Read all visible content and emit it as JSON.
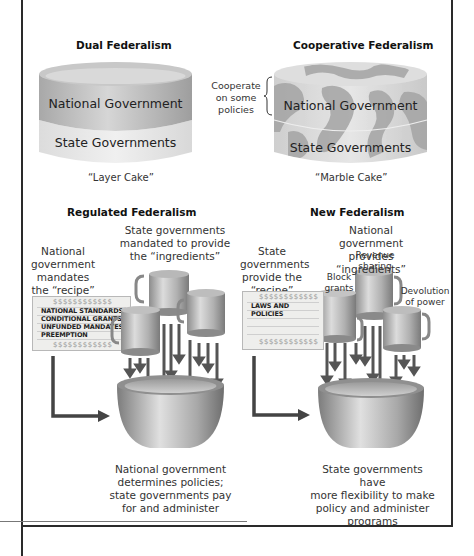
{
  "dual": {
    "title": "Dual Federalism",
    "top_layer": "National Government",
    "bottom_layer": "State Governments",
    "caption": "“Layer Cake”"
  },
  "cooperative": {
    "title": "Cooperative Federalism",
    "side_note_lines": [
      "Cooperate",
      "on some",
      "policies"
    ],
    "top_layer": "National Government",
    "bottom_layer": "State Governments",
    "caption": "“Marble Cake”"
  },
  "regulated": {
    "title": "Regulated Federalism",
    "ingredients_label_lines": [
      "State governments",
      "mandated to provide",
      "the “ingredients”"
    ],
    "recipe_label_lines": [
      "National",
      "government",
      "mandates",
      "the “recipe”"
    ],
    "card_dollars": "$$$$$$$$$$$$",
    "card_items": [
      "NATIONAL STANDARDS",
      "CONDITIONAL GRANTS",
      "UNFUNDED MANDATES",
      "PREEMPTION"
    ],
    "result_lines": [
      "National government",
      "determines policies;",
      "state governments pay",
      "for and administer"
    ]
  },
  "new": {
    "title": "New Federalism",
    "ingredients_label_lines": [
      "National government",
      "provides “ingredients”"
    ],
    "recipe_label_lines": [
      "State",
      "governments",
      "provide the",
      "“recipe”"
    ],
    "card_dollars": "$$$$$$$$$$$$",
    "card_items": [
      "LAWS AND",
      "POLICIES"
    ],
    "cup_labels": {
      "block": [
        "Block",
        "grants"
      ],
      "revenue": [
        "Revenue",
        "sharing"
      ],
      "devolution": [
        "Devolution",
        "of power"
      ]
    },
    "result_lines": [
      "State governments have",
      "more flexibility to make",
      "policy and administer",
      "programs"
    ]
  },
  "colors": {
    "border": "#2a2a2a",
    "cake_top": "#b5b5b5",
    "cake_bottom": "#e2e2e2",
    "marble_dark": "#9a9a9a",
    "arrow": "#555555"
  }
}
